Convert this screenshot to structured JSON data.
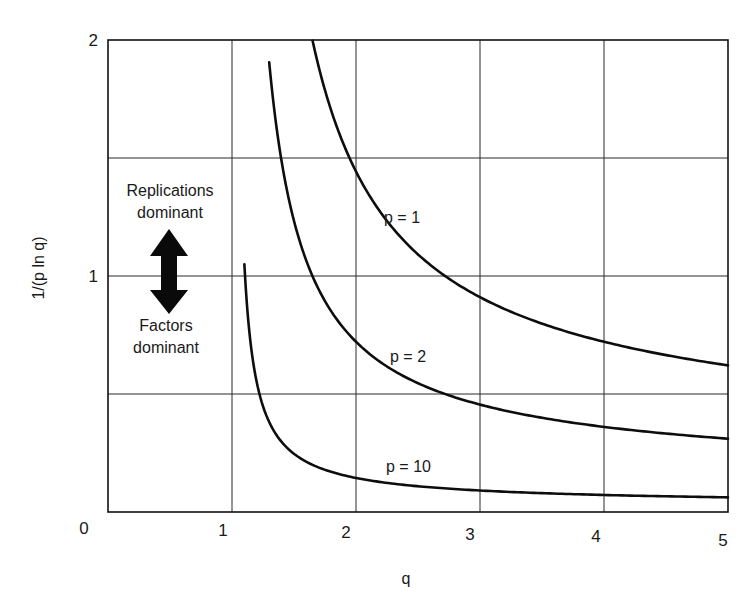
{
  "chart_data": {
    "type": "line",
    "title": "",
    "xlabel": "q",
    "ylabel": "1/(p ln q)",
    "xlim": [
      0,
      5
    ],
    "ylim": [
      0,
      2
    ],
    "x_ticks": [
      "0",
      "1",
      "2",
      "3",
      "4",
      "5"
    ],
    "y_ticks": [
      "0",
      "1",
      "2"
    ],
    "y_gridlines": [
      0.5,
      1,
      1.5
    ],
    "x_gridlines": [
      1,
      2,
      3,
      4
    ],
    "grid": true,
    "legend": "none (curves labeled inline)",
    "formula": "y = 1/(p ln q)",
    "series": [
      {
        "name": "p = 1",
        "label": "p = 1",
        "x": [
          1.65,
          1.8,
          2.0,
          2.25,
          2.5,
          2.75,
          3.0,
          3.5,
          4.0,
          4.5,
          5.0
        ],
        "values": [
          2.0,
          1.7,
          1.44,
          1.23,
          1.09,
          0.99,
          0.91,
          0.8,
          0.72,
          0.66,
          0.62
        ]
      },
      {
        "name": "p = 2",
        "label": "p = 2",
        "x": [
          1.3,
          1.4,
          1.5,
          1.75,
          2.0,
          2.5,
          3.0,
          3.5,
          4.0,
          4.5,
          5.0
        ],
        "values": [
          1.9,
          1.49,
          1.23,
          0.89,
          0.72,
          0.55,
          0.46,
          0.4,
          0.36,
          0.33,
          0.31
        ]
      },
      {
        "name": "p = 10",
        "label": "p = 10",
        "x": [
          1.1,
          1.15,
          1.2,
          1.3,
          1.5,
          1.75,
          2.0,
          2.5,
          3.0,
          4.0,
          5.0
        ],
        "values": [
          1.08,
          0.72,
          0.55,
          0.38,
          0.25,
          0.18,
          0.14,
          0.11,
          0.09,
          0.07,
          0.06
        ]
      }
    ],
    "annotations": [
      {
        "text": "Replications dominant",
        "lines": [
          "Replications",
          "dominant"
        ],
        "position": "upper-left, above arrow"
      },
      {
        "text": "Factors dominant",
        "lines": [
          "Factors",
          "dominant"
        ],
        "position": "left, below arrow"
      },
      {
        "text": "double-headed vertical arrow",
        "position": "x≈0.5, y≈1"
      }
    ]
  },
  "labels": {
    "xlabel": "q",
    "ylabel": "1/(p ln q)",
    "x_ticks": [
      "0",
      "1",
      "2",
      "3",
      "4",
      "5"
    ],
    "y_ticks": [
      "0",
      "1",
      "2"
    ],
    "p1": "p = 1",
    "p2": "p = 2",
    "p10": "p = 10",
    "replications_line1": "Replications",
    "replications_line2": "dominant",
    "factors_line1": "Factors",
    "factors_line2": "dominant"
  }
}
